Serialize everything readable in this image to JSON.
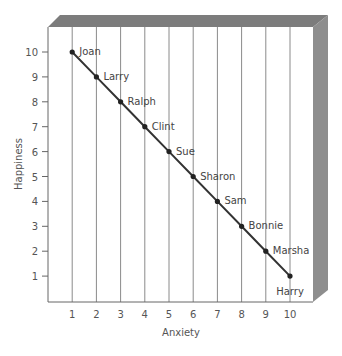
{
  "chart_data": {
    "type": "line",
    "title": "",
    "xlabel": "Anxiety",
    "ylabel": "Happiness",
    "xlim": [
      0,
      10
    ],
    "ylim": [
      0,
      10
    ],
    "x_ticks": [
      1,
      2,
      3,
      4,
      5,
      6,
      7,
      8,
      9,
      10
    ],
    "y_ticks": [
      1,
      2,
      3,
      4,
      5,
      6,
      7,
      8,
      9,
      10
    ],
    "grid": "vertical lines at each x tick",
    "legend": null,
    "series": [
      {
        "name": "Anxiety vs Happiness",
        "points": [
          {
            "label": "Joan",
            "x": 1,
            "y": 10
          },
          {
            "label": "Larry",
            "x": 2,
            "y": 9
          },
          {
            "label": "Ralph",
            "x": 3,
            "y": 8
          },
          {
            "label": "Clint",
            "x": 4,
            "y": 7
          },
          {
            "label": "Sue",
            "x": 5,
            "y": 6
          },
          {
            "label": "Sharon",
            "x": 6,
            "y": 5
          },
          {
            "label": "Sam",
            "x": 7,
            "y": 4
          },
          {
            "label": "Bonnie",
            "x": 8,
            "y": 3
          },
          {
            "label": "Marsha",
            "x": 9,
            "y": 2
          },
          {
            "label": "Harry",
            "x": 10,
            "y": 1
          }
        ]
      }
    ]
  },
  "colors": {
    "background": "#ffffff",
    "frame_shadow_top": "#7c7c7c",
    "frame_shadow_side": "#8e8e8e",
    "gridline": "#8a8a8a",
    "axis": "#666666",
    "data_line": "#333333",
    "text": "#555555"
  }
}
